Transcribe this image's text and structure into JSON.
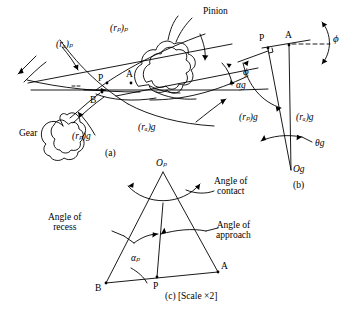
{
  "figure": {
    "background_color": "#ffffff",
    "stroke_color": "#000000"
  },
  "panel_a": {
    "caption": "(a)",
    "labels": {
      "pinion": "Pinion",
      "gear": "Gear",
      "pitch_radius_pinion": "(rₚ)ₚ",
      "addendum_radius_pinion": "(rₐ)ₚ",
      "pitch_radius_gear": "(rₚ)g",
      "addendum_radius_gear": "(rₐ)g",
      "pressure_angle": "ϕ",
      "point_p": "P",
      "point_a": "A",
      "point_b": "B"
    }
  },
  "panel_b": {
    "caption": "(b)",
    "labels": {
      "point_p": "P",
      "point_a": "A",
      "pressure_angle": "ϕ",
      "alpha_gear": "αg",
      "pitch_radius_gear": "(rₚ)g",
      "addendum_radius_gear": "(rₐ)g",
      "theta_gear": "θg",
      "center_gear": "Og"
    }
  },
  "panel_c": {
    "caption": "(c) [Scale ×2]",
    "labels": {
      "center_pinion": "Oₚ",
      "angle_of_contact": "Angle of contact",
      "angle_of_contact_line1": "Angle of",
      "angle_of_contact_line2": "contact",
      "angle_of_recess_line1": "Angle of",
      "angle_of_recess_line2": "recess",
      "angle_of_approach_line1": "Angle of",
      "angle_of_approach_line2": "approach",
      "alpha_pinion": "αₚ",
      "point_a": "A",
      "point_b": "B",
      "point_p": "P"
    }
  }
}
